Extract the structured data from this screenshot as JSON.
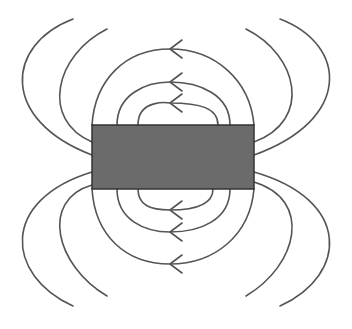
{
  "diagram": {
    "title": "",
    "type": "bar-magnet-field-lines",
    "colors": {
      "background": "#ffffff",
      "magnet_fill": "#6b6b6b",
      "magnet_stroke": "#333333",
      "line": "#555555"
    },
    "magnet": {
      "x": 92,
      "y": 125,
      "width": 162,
      "height": 64
    },
    "inner_loops_top": [
      {
        "d": "M138,125 C138,98 170,103 170,103 C200,103 218,108 218,125",
        "arrow_x": 170,
        "arrow_y": 103
      },
      {
        "d": "M117,125 C117,95 145,82 170,82 C200,82 230,95 230,125",
        "arrow_x": 170,
        "arrow_y": 82
      },
      {
        "d": "M92,125 C95,80 125,49 170,49 C215,49 250,80 254,125",
        "arrow_x": 170,
        "arrow_y": 49
      }
    ],
    "inner_loops_bottom": [
      {
        "d": "M138,189 C138,205 150,210 170,210 C200,210 213,203 213,189",
        "arrow_x": 170,
        "arrow_y": 210
      },
      {
        "d": "M117,189 C117,220 145,232 170,232 C200,232 230,220 230,189",
        "arrow_x": 170,
        "arrow_y": 232
      },
      {
        "d": "M92,189 C95,235 125,264 170,264 C215,264 250,235 254,189",
        "arrow_x": 170,
        "arrow_y": 264
      }
    ],
    "outer_lines": [
      {
        "name": "outer-left-top-1",
        "d": "M73,19 C5,45 0,120 92,155"
      },
      {
        "name": "outer-left-top-2",
        "d": "M107,29 C55,55 40,120 92,142"
      },
      {
        "name": "outer-left-bottom-1",
        "d": "M92,172 C0,200 5,275 73,306"
      },
      {
        "name": "outer-left-bottom-2",
        "d": "M92,185 C40,200 55,265 107,296"
      },
      {
        "name": "outer-right-top-1",
        "d": "M280,19 C348,45 352,120 254,155"
      },
      {
        "name": "outer-right-top-2",
        "d": "M246,29 C298,55 313,120 254,142"
      },
      {
        "name": "outer-right-bottom-1",
        "d": "M254,172 C352,200 348,275 280,306"
      },
      {
        "name": "outer-right-bottom-2",
        "d": "M254,182 C313,200 298,265 246,296"
      }
    ],
    "arrow_direction": "left"
  }
}
